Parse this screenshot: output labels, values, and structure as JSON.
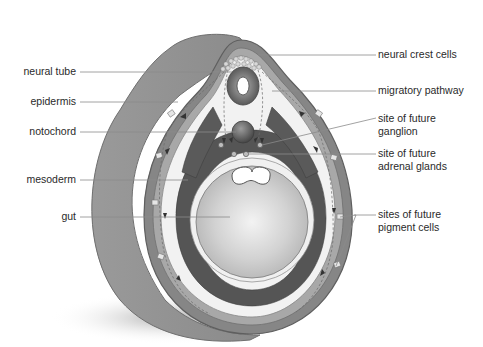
{
  "figure": {
    "colors": {
      "background": "#ffffff",
      "outer_body": "#8f8f8f",
      "outer_body_light": "#b4b4b4",
      "epidermis_band": "#7d7d7d",
      "inner_space": "#efefef",
      "mesoderm": "#555555",
      "gut": "#c9c9c9",
      "gut_highlight": "#ececec",
      "neural_tube": "#6e6e6e",
      "notochord": "#5e5e5e",
      "leader_line": "#8a8a8a",
      "label_text": "#2a2a2a"
    }
  },
  "labels_left": [
    {
      "id": "neural-tube",
      "text": "neural tube"
    },
    {
      "id": "epidermis",
      "text": "epidermis"
    },
    {
      "id": "notochord",
      "text": "notochord"
    },
    {
      "id": "mesoderm",
      "text": "mesoderm"
    },
    {
      "id": "gut",
      "text": "gut"
    }
  ],
  "labels_right": [
    {
      "id": "neural-crest-cells",
      "line1": "neural crest cells",
      "line2": ""
    },
    {
      "id": "migratory-pathway",
      "line1": "migratory pathway",
      "line2": ""
    },
    {
      "id": "site-future-ganglion",
      "line1": "site of future",
      "line2": "ganglion"
    },
    {
      "id": "site-future-adrenal",
      "line1": "site of future",
      "line2": "adrenal glands"
    },
    {
      "id": "sites-future-pigment",
      "line1": "sites of future",
      "line2": "pigment cells"
    }
  ]
}
